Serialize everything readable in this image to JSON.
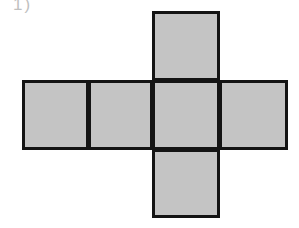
{
  "figure": {
    "kind": "cube-net-diagram",
    "corner_mark": "1)",
    "background_color": "#ffffff",
    "face_fill_color": "#c4c4c4",
    "face_border_color": "#141414",
    "face_border_width_px": 3,
    "face_count": 6,
    "faces": [
      {
        "id": "face-top",
        "position": "top",
        "row": 0,
        "column": 2
      },
      {
        "id": "face-left",
        "position": "left",
        "row": 1,
        "column": 0
      },
      {
        "id": "face-mid-left",
        "position": "mid-left",
        "row": 1,
        "column": 1
      },
      {
        "id": "face-center",
        "position": "center",
        "row": 1,
        "column": 2
      },
      {
        "id": "face-right",
        "position": "right",
        "row": 1,
        "column": 3
      },
      {
        "id": "face-bottom",
        "position": "bottom",
        "row": 2,
        "column": 2
      }
    ]
  }
}
